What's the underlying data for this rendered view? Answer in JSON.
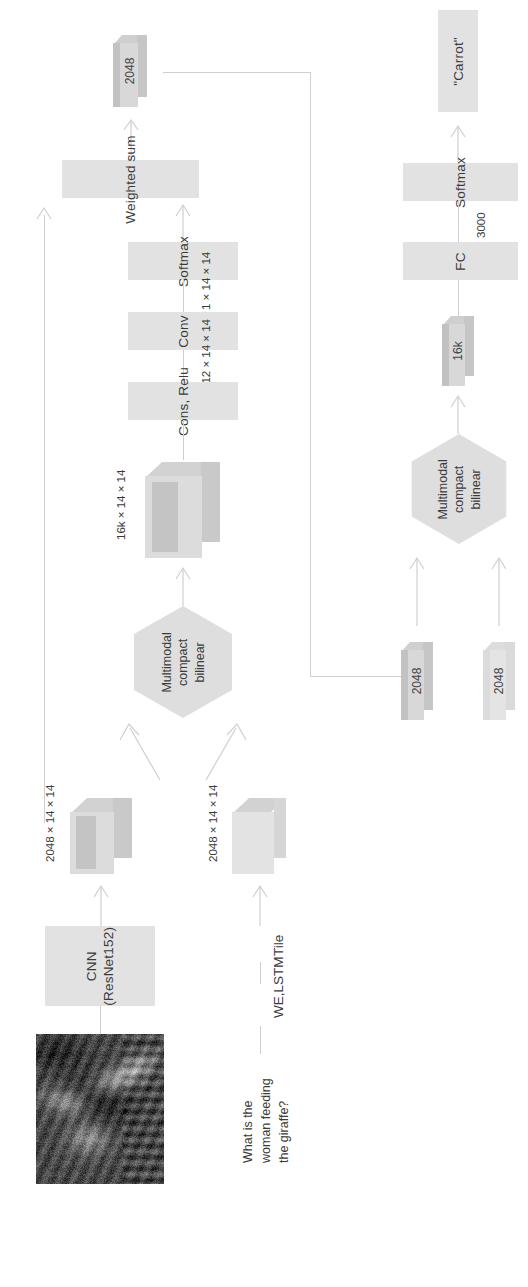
{
  "diagram": {
    "orientation": "rotated-90",
    "palette": {
      "node_fill": "#e2e2e2",
      "hex_fill": "#dedede",
      "slab_fill": "#d8d8d8",
      "line": "#cfcfcf",
      "text": "#3a3a3a"
    }
  },
  "nodes": {
    "attention_output": "2048",
    "answer": "\"Carrot\"",
    "weighted_sum": "Weighted sum",
    "softmax_attention": "Softmax",
    "softmax_answer": "Softmax",
    "conv": "Conv",
    "conv_relu": "Cons, Relu",
    "fc": "FC",
    "mcb_attention": "Multimodal\ncompact\nbilinear",
    "mcb_answer": "Multimodal\ncompact\nbilinear",
    "cnn": "CNN\n(ResNet152)",
    "volume_16k": "16k",
    "feat_img_2048": "2048",
    "feat_txt_2048": "2048"
  },
  "edge_labels": {
    "softmax_to_conv": "1 × 14 × 14",
    "conv_to_relu": "512 × 14 × 14",
    "mcb_to_relu": "16k × 14 × 14",
    "img_feat": "2048 × 14 × 14",
    "txt_feat": "2048 × 14 × 14",
    "fc_to_softmax": "3000",
    "tile": "Tile",
    "we_lstm": "WE,LSTM"
  },
  "question": "What is the\nwoman feeding\nthe giraffe?",
  "image_thumbnail": {
    "alt": "woman feeding a giraffe photograph",
    "style": "grayscale-grainy"
  }
}
